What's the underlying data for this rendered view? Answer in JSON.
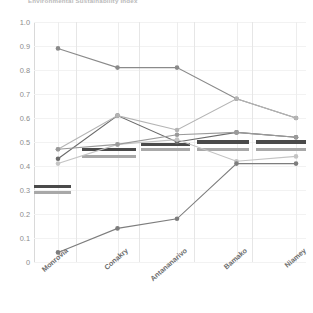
{
  "title": "Environmental Sustainability Index",
  "axis": {
    "y_ticks": [
      "1.0",
      "0.9",
      "0.8",
      "0.7",
      "0.6",
      "0.5",
      "0.4",
      "0.3",
      "0.2",
      "0.1",
      "0"
    ],
    "x_ticks": [
      "Monrovia",
      "Conakry",
      "Antananarivo",
      "Bamako",
      "Niamey"
    ]
  },
  "colors": {
    "series_dark": "#5f5f5f",
    "series_mid": "#8a8a8a",
    "series_light": "#b4b4b4",
    "series_pale": "#cfcfcf",
    "band_dark": "#4a4a4a",
    "band_light": "#a8a8a8",
    "grid": "#f2f2f2",
    "axis": "#d9d9d9",
    "tick_text": "#8c8c8c",
    "label_text": "#6e6e6e"
  },
  "chart_data": {
    "type": "line",
    "title": "Environmental Sustainability Index",
    "xlabel": "",
    "ylabel": "",
    "ylim": [
      0,
      1.0
    ],
    "ytick_values": [
      1.0,
      0.9,
      0.8,
      0.7,
      0.6,
      0.5,
      0.4,
      0.3,
      0.2,
      0.1,
      0.0
    ],
    "grid": true,
    "legend": "none",
    "categories": [
      "Monrovia",
      "Conakry",
      "Antananarivo",
      "Bamako",
      "Niamey"
    ],
    "series": [
      {
        "name": "series-1",
        "color": "#8a8a8a",
        "values": [
          0.89,
          0.81,
          0.81,
          0.68,
          0.6
        ]
      },
      {
        "name": "series-2",
        "color": "#6a6a6a",
        "values": [
          0.43,
          0.61,
          0.5,
          0.54,
          0.52
        ]
      },
      {
        "name": "series-3",
        "color": "#b4b4b4",
        "values": [
          0.47,
          0.61,
          0.55,
          0.68,
          0.6
        ]
      },
      {
        "name": "series-4",
        "color": "#c4c4c4",
        "values": [
          0.41,
          0.49,
          0.51,
          0.42,
          0.44
        ]
      },
      {
        "name": "series-5",
        "color": "#7d7d7d",
        "values": [
          0.04,
          0.14,
          0.18,
          0.41,
          0.41
        ]
      },
      {
        "name": "series-6",
        "color": "#9a9a9a",
        "values": [
          0.47,
          0.49,
          0.53,
          0.54,
          0.52
        ]
      }
    ],
    "reference_bands": [
      {
        "name": "band-dark-1",
        "kind": "dark",
        "segment": "Monrovia",
        "value": 0.315,
        "x_start": 0.0,
        "x_end": 0.135
      },
      {
        "name": "band-light-1",
        "kind": "light",
        "segment": "Monrovia",
        "value": 0.288,
        "x_start": 0.0,
        "x_end": 0.135
      },
      {
        "name": "band-dark-2",
        "kind": "dark",
        "segment": "Conakry",
        "value": 0.468,
        "x_start": 0.175,
        "x_end": 0.375
      },
      {
        "name": "band-light-2",
        "kind": "light",
        "segment": "Conakry",
        "value": 0.44,
        "x_start": 0.175,
        "x_end": 0.375
      },
      {
        "name": "band-dark-3",
        "kind": "dark",
        "segment": "Antananarivo",
        "value": 0.49,
        "x_start": 0.395,
        "x_end": 0.575
      },
      {
        "name": "band-light-3",
        "kind": "light",
        "segment": "Antananarivo",
        "value": 0.468,
        "x_start": 0.395,
        "x_end": 0.575
      },
      {
        "name": "band-dark-4",
        "kind": "dark",
        "segment": "Bamako",
        "value": 0.5,
        "x_start": 0.6,
        "x_end": 0.79
      },
      {
        "name": "band-light-4",
        "kind": "light",
        "segment": "Bamako",
        "value": 0.468,
        "x_start": 0.6,
        "x_end": 0.79
      },
      {
        "name": "band-dark-5",
        "kind": "dark",
        "segment": "Niamey",
        "value": 0.5,
        "x_start": 0.815,
        "x_end": 1.0
      },
      {
        "name": "band-light-5",
        "kind": "light",
        "segment": "Niamey",
        "value": 0.468,
        "x_start": 0.815,
        "x_end": 1.0
      }
    ]
  }
}
